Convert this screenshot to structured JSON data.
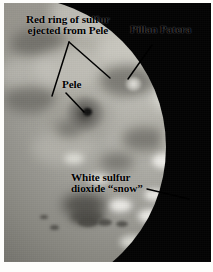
{
  "figure": {
    "subject": "Io",
    "medium": "grayscale spacecraft photograph with hand-drawn annotations",
    "background_color": "#fdfdfb",
    "photo": {
      "frame_color": "#8e8e8a",
      "night_side_color": "#050505",
      "surface_light_color": "#c9c8c1",
      "surface_dark_color": "#6f6e68",
      "snow_color": "#f0efea"
    }
  },
  "annotations": {
    "ink_color": "#000000",
    "callouts": [
      {
        "id": "red-ring",
        "line1": "Red ring of sulfur",
        "line2": "ejected from Pele",
        "text": "Red ring of sulfur\nejected from Pele"
      },
      {
        "id": "pillan-patera",
        "text": "Pillan Patera"
      },
      {
        "id": "pele",
        "text": "Pele"
      },
      {
        "id": "white-snow",
        "line1": "White sulfur",
        "line2": "dioxide “snow”",
        "text": "White sulfur\ndioxide “snow”"
      }
    ]
  },
  "features": {
    "pele_vent": "dark Pele volcanic vent",
    "pillan_vent": "bright-rimmed Pillan Patera vent",
    "right_crater": "dark-cored ringed patera on right limb",
    "snow_fields": "white sulfur dioxide frost deposits"
  }
}
